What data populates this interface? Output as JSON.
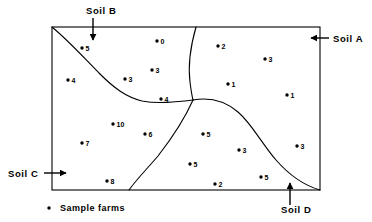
{
  "figure": {
    "frame": {
      "x": 52,
      "y": 27,
      "width": 268,
      "height": 163
    }
  },
  "soil_labels": [
    {
      "id": "soil-a",
      "text": "Soil A",
      "text_x": 333,
      "text_y": 42,
      "anchor": "start",
      "arrow": {
        "x1": 329,
        "y1": 38,
        "x2": 311,
        "y2": 38,
        "dir": "left"
      }
    },
    {
      "id": "soil-b",
      "text": "Soil B",
      "text_x": 86,
      "text_y": 14,
      "anchor": "start",
      "arrow": {
        "x1": 93,
        "y1": 18,
        "x2": 93,
        "y2": 40,
        "dir": "down"
      }
    },
    {
      "id": "soil-c",
      "text": "Soil C",
      "text_x": 8,
      "text_y": 177,
      "anchor": "start",
      "arrow": {
        "x1": 44,
        "y1": 173,
        "x2": 66,
        "y2": 173,
        "dir": "right"
      }
    },
    {
      "id": "soil-d",
      "text": "Soil D",
      "text_x": 281,
      "text_y": 213,
      "anchor": "start",
      "arrow": {
        "x1": 290,
        "y1": 205,
        "x2": 290,
        "y2": 183,
        "dir": "up"
      }
    }
  ],
  "legend": {
    "text": "Sample farms",
    "dot_x": 49,
    "dot_y": 208,
    "text_x": 60,
    "text_y": 211
  },
  "chart_data": {
    "type": "scatter",
    "title": "",
    "xlabel": "",
    "ylabel": "",
    "grid": false,
    "legend_position": "bottom-left",
    "regions": [
      "Soil A",
      "Soil B",
      "Soil C",
      "Soil D"
    ],
    "point_label_note": "Number beside each dot is the sample farm value",
    "points": [
      {
        "label": "5",
        "x": 82,
        "y": 48,
        "region": "Soil B"
      },
      {
        "label": "0",
        "x": 157,
        "y": 41,
        "region": "Soil B"
      },
      {
        "label": "2",
        "x": 218,
        "y": 46,
        "region": "Soil A"
      },
      {
        "label": "3",
        "x": 265,
        "y": 59,
        "region": "Soil A"
      },
      {
        "label": "3",
        "x": 152,
        "y": 70,
        "region": "Soil B"
      },
      {
        "label": "4",
        "x": 68,
        "y": 80,
        "region": "Soil C"
      },
      {
        "label": "3",
        "x": 125,
        "y": 79,
        "region": "Soil B"
      },
      {
        "label": "1",
        "x": 228,
        "y": 84,
        "region": "Soil A"
      },
      {
        "label": "1",
        "x": 287,
        "y": 95,
        "region": "Soil A"
      },
      {
        "label": "4",
        "x": 161,
        "y": 99,
        "region": "Soil B"
      },
      {
        "label": "10",
        "x": 113,
        "y": 124,
        "region": "Soil C"
      },
      {
        "label": "6",
        "x": 145,
        "y": 134,
        "region": "Soil C"
      },
      {
        "label": "5",
        "x": 203,
        "y": 134,
        "region": "Soil D"
      },
      {
        "label": "7",
        "x": 82,
        "y": 143,
        "region": "Soil C"
      },
      {
        "label": "3",
        "x": 239,
        "y": 150,
        "region": "Soil D"
      },
      {
        "label": "3",
        "x": 297,
        "y": 146,
        "region": "Soil A"
      },
      {
        "label": "5",
        "x": 190,
        "y": 164,
        "region": "Soil D"
      },
      {
        "label": "5",
        "x": 261,
        "y": 177,
        "region": "Soil D"
      },
      {
        "label": "8",
        "x": 107,
        "y": 181,
        "region": "Soil C"
      },
      {
        "label": "2",
        "x": 215,
        "y": 184,
        "region": "Soil D"
      }
    ],
    "boundaries": [
      {
        "name": "soil-b-soil-c-boundary",
        "path": "M 52,27 C 70,42 84,58 100,74 C 114,88 126,97 142,101 C 158,104 176,102 193,100"
      },
      {
        "name": "soil-a-soil-d-boundary",
        "path": "M 196,27 C 190,48 188,66 190,82 C 191,90 192,96 193,100"
      },
      {
        "name": "soil-c-soil-d-boundary",
        "path": "M 193,100 C 185,118 172,138 158,156 C 146,170 136,180 129,190"
      },
      {
        "name": "soil-a-soil-d-lower-boundary",
        "path": "M 193,100 C 210,97 224,100 238,112 C 252,124 262,144 276,160 C 290,176 306,186 320,190"
      }
    ]
  }
}
